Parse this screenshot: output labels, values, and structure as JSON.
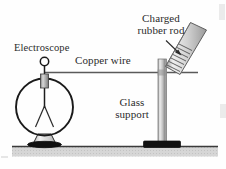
{
  "figure": {
    "width": 226,
    "height": 169,
    "background_color": "#fefefe"
  },
  "labels": {
    "electroscope": "Electroscope",
    "copper_wire": "Copper wire",
    "charged_rod_line1": "Charged",
    "charged_rod_line2": "rubber rod",
    "glass_support_line1": "Glass",
    "glass_support_line2": "support"
  },
  "colors": {
    "ink": "#2b2b2b",
    "outline": "#1a1a1a",
    "metal_light": "#e4e4e4",
    "metal_mid": "#b8b8b8",
    "metal_dark": "#8a8a8a",
    "base_black": "#111111",
    "ground_fill": "#d2d2d2",
    "ground_line": "#3a3a3a",
    "wire": "#555555"
  },
  "parts": {
    "electroscope_knob": "knob-circle",
    "electroscope_bulb": "glass-bulb-circle",
    "electroscope_leaves": "diverging-gold-leaves",
    "electroscope_collar": "metal-collar",
    "electroscope_stand": "pedestal-base",
    "glass_support_column": "vertical-glass-column",
    "glass_support_base": "black-base-plate",
    "rubber_rod": "tilted-hatched-rod",
    "pointer_arrow": "arrow-to-rod",
    "ground": "ground-surface-band"
  }
}
